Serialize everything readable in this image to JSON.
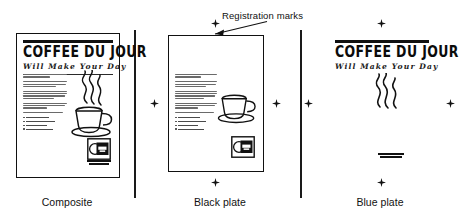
{
  "figure": {
    "annotation": {
      "label": "Registration marks",
      "arrow_icon": "arrow-pointer-icon"
    },
    "flyer": {
      "title": "COFFEE DU JOUR",
      "subtitle": "Will Make Your Day",
      "body_paragraphs": [
        2,
        3,
        4,
        3,
        2
      ],
      "bullet_count": 4,
      "artwork": {
        "cup_icon": "coffee-cup-icon",
        "steam_icon": "steam-swirl-icon"
      },
      "logo": {
        "icon": "coffee-shop-logo-icon",
        "tagline_line1": "Coffee Du Jour",
        "tagline_line2": "Will Make Your Day"
      }
    },
    "panels": [
      {
        "id": "composite",
        "caption": "Composite",
        "has_page_border": true,
        "shows_title": true,
        "shows_body": true,
        "shows_cup": true,
        "shows_steam": true,
        "shows_logo": true,
        "shows_regmarks": false
      },
      {
        "id": "black-plate",
        "caption": "Black plate",
        "has_page_border": true,
        "shows_title": false,
        "shows_body": true,
        "shows_cup": true,
        "shows_steam": false,
        "shows_logo": true,
        "shows_regmarks": true
      },
      {
        "id": "blue-plate",
        "caption": "Blue plate",
        "has_page_border": false,
        "shows_title": true,
        "shows_body": false,
        "shows_cup": false,
        "shows_steam": true,
        "shows_logo": false,
        "shows_regmarks": true
      }
    ],
    "colors": {
      "ink": "#111111",
      "background": "#ffffff",
      "greek_text": "#6a6a6a",
      "divider": "#1a1a1a"
    }
  }
}
